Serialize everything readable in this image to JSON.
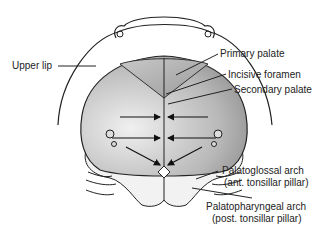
{
  "diagram": {
    "labels": {
      "upper_lip": "Upper lip",
      "primary_palate": "Primary palate",
      "incisive_foramen": "Incisive foramen",
      "secondary_palate": "Secondary palate",
      "palatoglossal_line1": "Palatoglossal arch",
      "palatoglossal_line2": "(ant. tonsillar pillar)",
      "palatopharyngeal_line1": "Palatopharyngeal arch",
      "palatopharyngeal_line2": "(post. tonsillar pillar)"
    },
    "colors": {
      "outline": "#222222",
      "palate_light": "#e6e6e6",
      "palate_dark": "#8a8a8a",
      "primary_palate": "#b0b0b0",
      "soft_palate": "#f2f2f2"
    }
  }
}
